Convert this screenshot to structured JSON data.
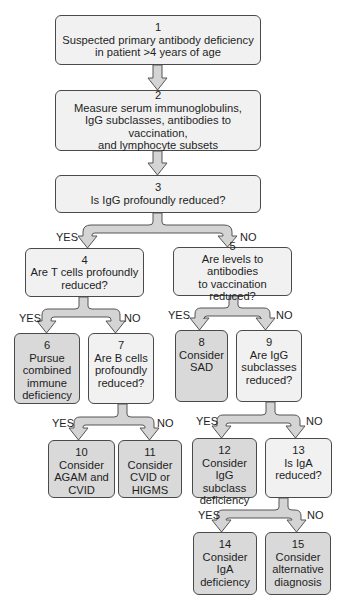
{
  "diagram": {
    "type": "flowchart",
    "nodes": [
      {
        "id": 1,
        "num": "1",
        "text": "Suspected primary antibody deficiency\nin patient >4 years of age",
        "kind": "start"
      },
      {
        "id": 2,
        "num": "2",
        "text": "Measure serum immunoglobulins,\nIgG subclasses, antibodies to vaccination,\nand lymphocyte subsets",
        "kind": "action"
      },
      {
        "id": 3,
        "num": "3",
        "text": "Is IgG profoundly reduced?",
        "kind": "question"
      },
      {
        "id": 4,
        "num": "4",
        "text": "Are T cells profoundly\nreduced?",
        "kind": "question"
      },
      {
        "id": 5,
        "num": "5",
        "text": "Are levels to antibodies\nto vaccination reduced?",
        "kind": "question"
      },
      {
        "id": 6,
        "num": "6",
        "text": "Pursue\ncombined\nimmune\ndeficiency",
        "kind": "outcome"
      },
      {
        "id": 7,
        "num": "7",
        "text": "Are B cells\nprofoundly\nreduced?",
        "kind": "question"
      },
      {
        "id": 8,
        "num": "8",
        "text": "Consider\nSAD",
        "kind": "outcome"
      },
      {
        "id": 9,
        "num": "9",
        "text": "Are IgG\nsubclasses\nreduced?",
        "kind": "question"
      },
      {
        "id": 10,
        "num": "10",
        "text": "Consider\nAGAM and\nCVID",
        "kind": "outcome"
      },
      {
        "id": 11,
        "num": "11",
        "text": "Consider\nCVID or\nHIGMS",
        "kind": "outcome"
      },
      {
        "id": 12,
        "num": "12",
        "text": "Consider IgG\nsubclass\ndeficiency",
        "kind": "outcome"
      },
      {
        "id": 13,
        "num": "13",
        "text": "Is IgA\nreduced?",
        "kind": "question"
      },
      {
        "id": 14,
        "num": "14",
        "text": "Consider IgA\ndeficiency",
        "kind": "outcome"
      },
      {
        "id": 15,
        "num": "15",
        "text": "Consider\nalternative\ndiagnosis",
        "kind": "outcome"
      }
    ],
    "edges": [
      {
        "from": 1,
        "to": 2,
        "label": ""
      },
      {
        "from": 2,
        "to": 3,
        "label": ""
      },
      {
        "from": 3,
        "to": 4,
        "label": "YES"
      },
      {
        "from": 3,
        "to": 5,
        "label": "NO"
      },
      {
        "from": 4,
        "to": 6,
        "label": "YES"
      },
      {
        "from": 4,
        "to": 7,
        "label": "NO"
      },
      {
        "from": 5,
        "to": 8,
        "label": "YES"
      },
      {
        "from": 5,
        "to": 9,
        "label": "NO"
      },
      {
        "from": 7,
        "to": 10,
        "label": "YES"
      },
      {
        "from": 7,
        "to": 11,
        "label": "NO"
      },
      {
        "from": 9,
        "to": 12,
        "label": "YES"
      },
      {
        "from": 9,
        "to": 13,
        "label": "NO"
      },
      {
        "from": 13,
        "to": 14,
        "label": "YES"
      },
      {
        "from": 13,
        "to": 15,
        "label": "NO"
      }
    ],
    "labels": {
      "yes": "YES",
      "no": "NO"
    },
    "colors": {
      "question_fill": "#f1f1f1",
      "outcome_fill": "#d9d9d9",
      "border": "#4a4a4a",
      "arrow_fill": "#d4d4d4"
    }
  }
}
